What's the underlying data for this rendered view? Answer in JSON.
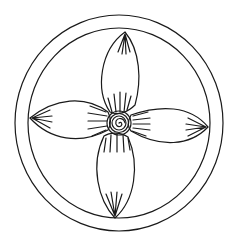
{
  "illustration": {
    "subject": "four-petal flower inside double circle",
    "stroke_color": "#1a1a1a",
    "background_color": "#ffffff",
    "center": [
      119,
      123
    ],
    "outer_ring_radius": [
      104,
      108
    ],
    "inner_ring_radius": [
      91,
      95
    ],
    "petals": [
      "top",
      "right",
      "bottom",
      "left"
    ]
  }
}
